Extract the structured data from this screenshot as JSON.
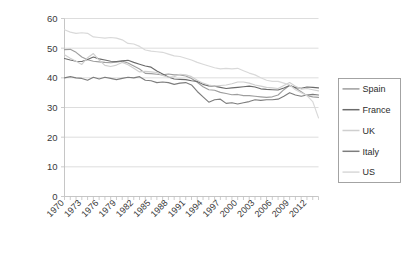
{
  "chart_data": {
    "type": "line",
    "title": "",
    "subtitle": "",
    "xlabel": "",
    "ylabel": "",
    "xlim": [
      1970,
      2014
    ],
    "ylim": [
      0,
      60
    ],
    "y_ticks": [
      0,
      10,
      20,
      30,
      40,
      50,
      60
    ],
    "x_ticks": [
      1970,
      1973,
      1976,
      1979,
      1982,
      1985,
      1988,
      1991,
      1994,
      1997,
      2000,
      2003,
      2006,
      2009,
      2012
    ],
    "x_tick_labels": [
      "1970",
      "1973",
      "1976",
      "1979",
      "1982",
      "1985",
      "1988",
      "1991",
      "1994",
      "1997",
      "2000",
      "2003",
      "2006",
      "2009",
      "2012"
    ],
    "y_tick_labels": [
      "0",
      "10",
      "20",
      "30",
      "40",
      "50",
      "60"
    ],
    "grid": "horizontal",
    "legend_position": "right",
    "x": [
      1970,
      1971,
      1972,
      1973,
      1974,
      1975,
      1976,
      1977,
      1978,
      1979,
      1980,
      1981,
      1982,
      1983,
      1984,
      1985,
      1986,
      1987,
      1988,
      1989,
      1990,
      1991,
      1992,
      1993,
      1994,
      1995,
      1996,
      1997,
      1998,
      1999,
      2000,
      2001,
      2002,
      2003,
      2004,
      2005,
      2006,
      2007,
      2008,
      2009,
      2010,
      2011,
      2012,
      2013,
      2014
    ],
    "series": [
      {
        "name": "Spain",
        "color": "#9e9e9e",
        "values": [
          49.5,
          49.6,
          48.6,
          47.0,
          46.1,
          45.6,
          45.4,
          45.2,
          45.1,
          45.3,
          45.6,
          45.0,
          44.0,
          43.0,
          41.5,
          41.4,
          41.2,
          41.0,
          41.3,
          41.0,
          41.0,
          40.6,
          39.8,
          38.5,
          37.0,
          36.0,
          35.8,
          35.1,
          34.7,
          34.3,
          34.4,
          34.0,
          34.0,
          33.8,
          33.6,
          33.4,
          33.6,
          34.2,
          36.0,
          37.5,
          36.6,
          35.3,
          34.0,
          33.6,
          33.4
        ]
      },
      {
        "name": "France",
        "color": "#6b6b6b",
        "values": [
          46.5,
          46.0,
          45.6,
          45.5,
          46.2,
          47.0,
          46.4,
          46.0,
          45.6,
          45.5,
          45.7,
          45.9,
          45.2,
          44.6,
          44.0,
          43.6,
          42.3,
          41.3,
          40.3,
          39.6,
          39.5,
          39.4,
          39.0,
          38.8,
          37.8,
          37.3,
          37.2,
          36.8,
          36.4,
          36.6,
          36.8,
          37.0,
          37.2,
          36.9,
          36.3,
          36.1,
          36.0,
          35.9,
          36.6,
          37.4,
          36.7,
          36.5,
          36.9,
          36.8,
          36.6
        ]
      },
      {
        "name": "UK",
        "color": "#cfcfcf",
        "values": [
          47.8,
          46.6,
          45.6,
          44.5,
          46.8,
          48.2,
          46.0,
          44.2,
          43.8,
          44.3,
          45.2,
          44.4,
          43.2,
          42.0,
          42.2,
          42.0,
          41.8,
          40.8,
          40.2,
          40.4,
          41.2,
          41.0,
          40.4,
          39.2,
          38.2,
          37.6,
          37.2,
          37.4,
          37.6,
          38.0,
          38.6,
          38.6,
          38.2,
          37.6,
          37.2,
          36.8,
          36.6,
          36.4,
          37.4,
          38.4,
          37.2,
          36.2,
          36.4,
          36.0,
          35.6
        ]
      },
      {
        "name": "Italy",
        "color": "#7d7d7d",
        "values": [
          40.0,
          40.4,
          40.0,
          39.8,
          39.2,
          40.2,
          39.6,
          40.2,
          39.8,
          39.4,
          39.8,
          40.2,
          40.0,
          40.4,
          39.2,
          39.0,
          38.4,
          38.6,
          38.4,
          37.8,
          38.2,
          38.4,
          37.6,
          35.4,
          33.6,
          31.8,
          32.6,
          32.8,
          31.4,
          31.6,
          31.2,
          31.6,
          32.0,
          32.6,
          32.4,
          32.6,
          32.6,
          32.8,
          33.8,
          35.0,
          34.2,
          33.8,
          34.2,
          34.4,
          34.2
        ]
      },
      {
        "name": "US",
        "color": "#d9d9d9",
        "values": [
          56.2,
          55.4,
          55.0,
          55.2,
          55.0,
          53.8,
          53.6,
          53.4,
          53.6,
          53.4,
          52.8,
          51.6,
          51.4,
          50.6,
          49.4,
          49.0,
          48.8,
          48.6,
          48.0,
          47.4,
          47.2,
          46.6,
          46.0,
          45.2,
          44.6,
          44.0,
          43.4,
          43.0,
          43.2,
          43.0,
          43.2,
          42.4,
          41.6,
          41.0,
          40.0,
          39.2,
          38.8,
          38.8,
          38.2,
          37.6,
          36.0,
          35.0,
          34.0,
          32.0,
          26.5
        ]
      }
    ]
  },
  "legend": {
    "items": [
      {
        "label": "Spain"
      },
      {
        "label": "France"
      },
      {
        "label": "UK"
      },
      {
        "label": "Italy"
      },
      {
        "label": "US"
      }
    ]
  }
}
